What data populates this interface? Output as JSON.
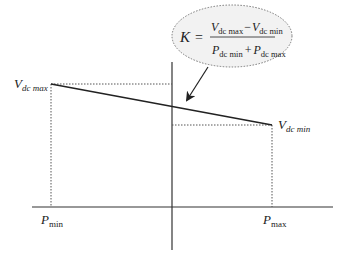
{
  "diagram": {
    "formula": {
      "lhs": "K",
      "equals": "=",
      "numerator": {
        "term1": {
          "symbol": "V",
          "subscript": "dc max"
        },
        "operator": "−",
        "term2": {
          "symbol": "V",
          "subscript": "dc min"
        }
      },
      "denominator": {
        "term1": {
          "symbol": "P",
          "subscript": "dc min"
        },
        "operator": "+",
        "term2": {
          "symbol": "P",
          "subscript": "dc max"
        }
      }
    },
    "labels": {
      "vdc_max": {
        "symbol": "V",
        "subscript": "dc max"
      },
      "vdc_min": {
        "symbol": "V",
        "subscript": "dc min"
      },
      "p_min": {
        "symbol": "P",
        "subscript": "min"
      },
      "p_max": {
        "symbol": "P",
        "subscript": "max"
      }
    },
    "colors": {
      "line": "#222222",
      "dotted": "#555555",
      "ellipse_fill": "#f2f2f2",
      "ellipse_stroke": "#777777"
    }
  }
}
